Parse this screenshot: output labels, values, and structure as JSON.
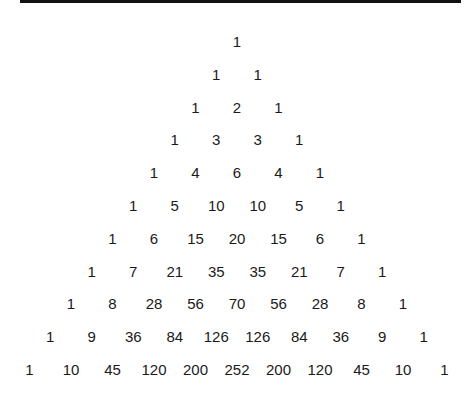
{
  "rows": [
    [
      1
    ],
    [
      1,
      1
    ],
    [
      1,
      2,
      1
    ],
    [
      1,
      3,
      3,
      1
    ],
    [
      1,
      4,
      6,
      4,
      1
    ],
    [
      1,
      5,
      10,
      10,
      5,
      1
    ],
    [
      1,
      6,
      15,
      20,
      15,
      6,
      1
    ],
    [
      1,
      7,
      21,
      35,
      35,
      21,
      7,
      1
    ],
    [
      1,
      8,
      28,
      56,
      70,
      56,
      28,
      8,
      1
    ],
    [
      1,
      9,
      36,
      84,
      126,
      126,
      84,
      36,
      9,
      1
    ],
    [
      1,
      10,
      45,
      120,
      200,
      252,
      200,
      120,
      45,
      10,
      1
    ]
  ]
}
